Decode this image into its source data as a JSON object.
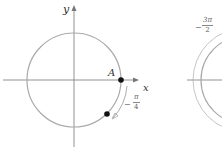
{
  "figure_left": {
    "axis_labels": {
      "x": "x",
      "y": "y"
    },
    "point_label": "A",
    "angle_label": {
      "sign": "−",
      "numerator": "π",
      "denominator": "4"
    },
    "colors": {
      "circle": "#aaaaaa",
      "axis": "#777777",
      "arc": "#888888",
      "point": "#111111"
    }
  },
  "figure_right": {
    "angle_label": {
      "sign": "−",
      "numerator": "3π",
      "denominator": "2"
    },
    "colors": {
      "circle": "#aaaaaa",
      "axis": "#777777"
    }
  }
}
